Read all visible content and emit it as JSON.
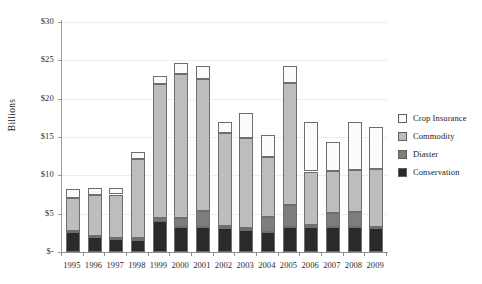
{
  "chart_data": {
    "type": "bar",
    "stacked": true,
    "title": "",
    "subtitle": "",
    "xlabel": "",
    "ylabel": "Billions",
    "ylim": [
      0,
      30
    ],
    "ytick_values": [
      0,
      5,
      10,
      15,
      20,
      25,
      30
    ],
    "ytick_labels": [
      "$-",
      "$5",
      "$10",
      "$15",
      "$20",
      "$25",
      "$30"
    ],
    "grid": true,
    "grid_axis": "y",
    "legend_position": "right",
    "categories": [
      "1995",
      "1996",
      "1997",
      "1998",
      "1999",
      "2000",
      "2001",
      "2002",
      "2003",
      "2004",
      "2005",
      "2006",
      "2007",
      "2008",
      "2009"
    ],
    "series": [
      {
        "name": "Conservation",
        "color": "#2a2a2a",
        "values": [
          2.6,
          2.0,
          1.7,
          1.6,
          4.0,
          3.2,
          3.2,
          3.1,
          2.9,
          2.6,
          3.2,
          3.2,
          3.2,
          3.3,
          3.1
        ]
      },
      {
        "name": "Diaster",
        "color": "#7d7d7d",
        "values": [
          0.1,
          0.1,
          0.1,
          0.2,
          0.4,
          1.2,
          2.1,
          0.3,
          0.2,
          2.0,
          2.9,
          0.3,
          1.9,
          1.9,
          0.2
        ]
      },
      {
        "name": "Commodity",
        "color": "#bdbdbd",
        "values": [
          4.4,
          5.3,
          5.7,
          10.3,
          17.5,
          18.8,
          17.3,
          12.1,
          11.8,
          7.8,
          15.9,
          7.0,
          5.5,
          5.5,
          7.5
        ]
      },
      {
        "name": "Crop Insurance",
        "color": "#fbfbfb",
        "values": [
          1.1,
          0.9,
          0.9,
          1.0,
          1.1,
          1.5,
          1.6,
          1.5,
          3.2,
          2.9,
          2.3,
          6.5,
          3.8,
          6.3,
          5.5
        ]
      }
    ],
    "totals": [
      8.2,
      8.3,
      8.4,
      13.1,
      23.0,
      24.7,
      24.2,
      17.0,
      18.1,
      15.3,
      24.3,
      17.0,
      14.4,
      17.0,
      16.3
    ]
  },
  "legend": {
    "items": [
      {
        "label": "Crop Insurance",
        "swatch": "#fbfbfb"
      },
      {
        "label": "Commodity",
        "swatch": "#bdbdbd"
      },
      {
        "label": "Diaster",
        "swatch": "#7d7d7d"
      },
      {
        "label": "Conservation",
        "swatch": "#2a2a2a"
      }
    ]
  }
}
